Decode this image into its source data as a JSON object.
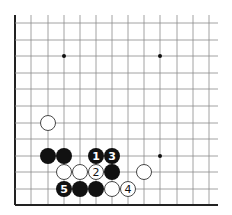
{
  "diagram": {
    "type": "go-board-corner",
    "grid": {
      "x0": 15,
      "y0": 23,
      "cols": 13,
      "rows": 12,
      "xs": [
        15,
        31,
        48,
        64,
        80,
        96,
        112,
        128,
        144,
        160,
        177,
        193,
        209
      ],
      "ys": [
        23,
        40,
        56,
        73,
        89,
        106,
        123,
        139,
        156,
        172,
        189,
        205
      ],
      "line_end_x": 218,
      "line_top_y": 15,
      "line_color": "#8a8a8a",
      "edge_color": "#222222"
    },
    "star_points": [
      {
        "col": 3,
        "row": 2
      },
      {
        "col": 9,
        "row": 2
      },
      {
        "col": 9,
        "row": 8
      }
    ],
    "stones": [
      {
        "color": "white",
        "col": 2,
        "row": 6,
        "label": ""
      },
      {
        "color": "black",
        "col": 2,
        "row": 8,
        "label": ""
      },
      {
        "color": "black",
        "col": 3,
        "row": 8,
        "label": ""
      },
      {
        "color": "black",
        "col": 5,
        "row": 8,
        "label": "1"
      },
      {
        "color": "black",
        "col": 6,
        "row": 8,
        "label": "3"
      },
      {
        "color": "white",
        "col": 3,
        "row": 9,
        "label": ""
      },
      {
        "color": "white",
        "col": 4,
        "row": 9,
        "label": ""
      },
      {
        "color": "white",
        "col": 5,
        "row": 9,
        "label": "2"
      },
      {
        "color": "black",
        "col": 6,
        "row": 9,
        "label": ""
      },
      {
        "color": "white",
        "col": 8,
        "row": 9,
        "label": ""
      },
      {
        "color": "black",
        "col": 3,
        "row": 10,
        "label": "5"
      },
      {
        "color": "black",
        "col": 4,
        "row": 10,
        "label": ""
      },
      {
        "color": "black",
        "col": 5,
        "row": 10,
        "label": ""
      },
      {
        "color": "white",
        "col": 6,
        "row": 10,
        "label": ""
      },
      {
        "color": "white",
        "col": 7,
        "row": 10,
        "label": "4"
      }
    ],
    "stone_radius": 8,
    "colors": {
      "black": "#111111",
      "white": "#ffffff",
      "white_stroke": "#333333"
    }
  }
}
